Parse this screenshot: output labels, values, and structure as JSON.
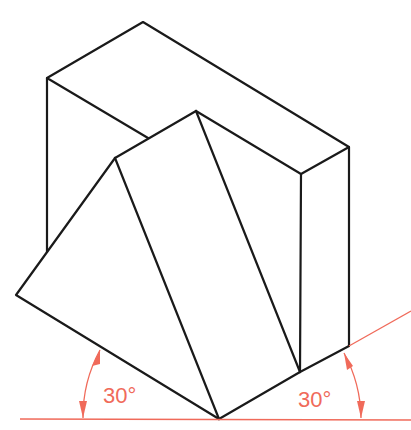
{
  "figure": {
    "type": "isometric drawing",
    "colors": {
      "object_lines": "#1a1a1a",
      "reference_lines": "#f06a5a",
      "background": "#ffffff"
    },
    "angle_labels": {
      "left": "30°",
      "right": "30°"
    }
  }
}
